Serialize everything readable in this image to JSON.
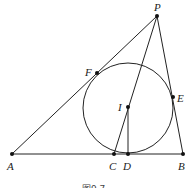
{
  "figure": {
    "caption": "图9.7",
    "labels": {
      "P": "P",
      "F": "F",
      "I": "I",
      "E": "E",
      "A": "A",
      "C": "C",
      "D": "D",
      "B": "B"
    }
  }
}
